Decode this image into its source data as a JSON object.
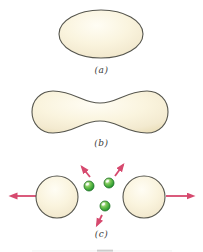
{
  "figure": {
    "type": "nuclear-fission-stages-diagram",
    "background": "#ffffff",
    "stages": [
      {
        "id": "a",
        "label": "(a)",
        "shape": "oval-nucleus"
      },
      {
        "id": "b",
        "label": "(b)",
        "shape": "dumbbell-elongated-nucleus"
      },
      {
        "id": "c",
        "label": "(c)",
        "shape": "two-fission-fragments-with-neutrons"
      }
    ],
    "counts": {
      "fragments": 2,
      "neutrons": 3,
      "arrows": 5
    },
    "colors": {
      "outline": "#56564e",
      "cream_light": "#fffdf4",
      "cream_mid": "#faf4de",
      "cream_shade": "#f3ead0",
      "cream_edge": "#ebdfbb",
      "arrow": "#d6496e",
      "neutron_highlight": "#eef9e4",
      "neutron_light": "#7cc857",
      "neutron_mid": "#2f9e33",
      "neutron_rim": "#1c6f22",
      "label_color": "#3a3a3a"
    }
  }
}
